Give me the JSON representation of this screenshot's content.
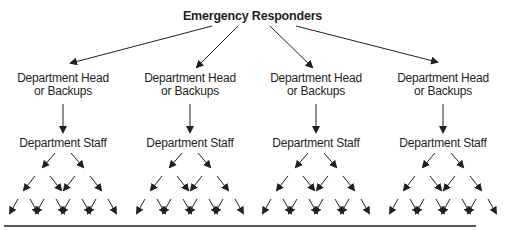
{
  "diagram": {
    "title": "Emergency Responders",
    "branches": [
      {
        "head_line1": "Department Head",
        "head_line2": "or Backups",
        "staff": "Department Staff"
      },
      {
        "head_line1": "Department Head",
        "head_line2": "or Backups",
        "staff": "Department Staff"
      },
      {
        "head_line1": "Department Head",
        "head_line2": "or Backups",
        "staff": "Department Staff"
      },
      {
        "head_line1": "Department Head",
        "head_line2": "or Backups",
        "staff": "Department Staff"
      }
    ],
    "colors": {
      "ink": "#231f20",
      "background": "#ffffff"
    }
  }
}
